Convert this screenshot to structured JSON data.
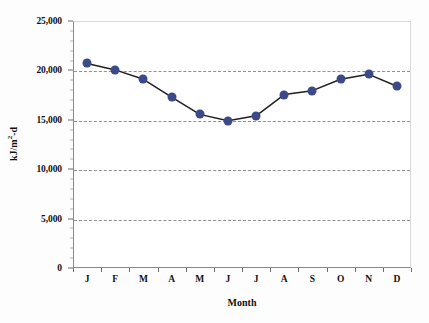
{
  "chart_data": {
    "type": "line",
    "title": "",
    "subtitle": "",
    "xlabel": "Month",
    "ylabel": "kJ/m2-d",
    "ylabel_display": "kJ/m",
    "ylabel_exponent": "2",
    "ylabel_suffix": "-d",
    "categories": [
      "J",
      "F",
      "M",
      "A",
      "M",
      "J",
      "J",
      "A",
      "S",
      "O",
      "N",
      "D"
    ],
    "values": [
      20700,
      20050,
      19100,
      17300,
      15550,
      14900,
      15400,
      17550,
      17950,
      19100,
      19600,
      18400
    ],
    "series": [
      {
        "name": "Monthly solar radiation",
        "values": [
          20700,
          20050,
          19100,
          17300,
          15550,
          14900,
          15400,
          17550,
          17950,
          19100,
          19600,
          18400
        ],
        "marker": "circle",
        "marker_color": "#3d4a8a",
        "line_color": "#221f1f"
      }
    ],
    "ylim": [
      0,
      25000
    ],
    "ytick_values": [
      0,
      5000,
      10000,
      15000,
      20000,
      25000
    ],
    "ytick_labels": [
      "0",
      "5,000",
      "10,000",
      "15,000",
      "20,000",
      "25,000"
    ],
    "y_minor_tick_step": 1000,
    "grid": "horizontal-dashed",
    "grid_color": "#7d7d7d",
    "legend": "none",
    "legend_position": "none",
    "background_color": "#ffffff",
    "axis_color": "#8a8a8a"
  },
  "axes": {
    "x_title": "Month",
    "y_title_base": "kJ/m",
    "y_title_sup": "2",
    "y_title_tail": "-d"
  }
}
